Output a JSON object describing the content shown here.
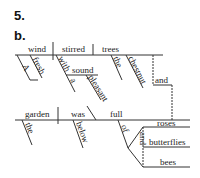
{
  "exercise": {
    "number": "5.",
    "part": "b."
  },
  "clause1": {
    "subject": "wind",
    "verb": "stirred",
    "object": "trees",
    "subject_modifiers": [
      "A",
      "fresh"
    ],
    "prep": "with",
    "prep_object": "sound",
    "prep_object_modifiers": [
      "a",
      "pleasant"
    ],
    "object_modifiers": [
      "the",
      "chestnut"
    ]
  },
  "conjunction": "and",
  "clause2": {
    "subject": "garden",
    "verb": "was",
    "complement": "full",
    "subject_modifiers": [
      "the"
    ],
    "verb_modifiers": [
      "below"
    ],
    "prep": "of",
    "prep_objects": [
      "roses",
      "butterflies",
      "bees"
    ],
    "prep_conj": "and"
  }
}
